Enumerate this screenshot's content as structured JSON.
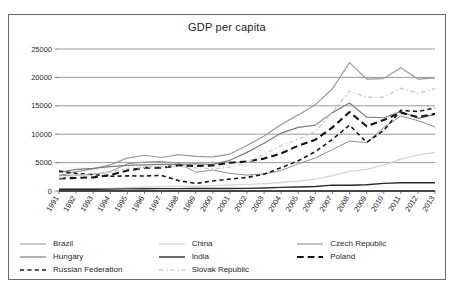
{
  "chart_data": {
    "type": "line",
    "title": "GDP per capita",
    "xlabel": "",
    "ylabel": "",
    "ylim": [
      0,
      25000
    ],
    "yticks": [
      0,
      5000,
      10000,
      15000,
      20000,
      25000
    ],
    "grid": true,
    "legend_position": "bottom",
    "categories": [
      "1991",
      "1992",
      "1993",
      "1994",
      "1995",
      "1996",
      "1997",
      "1998",
      "1999",
      "2000",
      "2001",
      "2002",
      "2003",
      "2004",
      "2005",
      "2006",
      "2007",
      "2008",
      "2009",
      "2010",
      "2011",
      "2012",
      "2013"
    ],
    "series": [
      {
        "name": "Brazil",
        "color": "#909090",
        "style": "solid",
        "width": 1,
        "values": [
          2700,
          2800,
          2900,
          3400,
          4800,
          5100,
          5200,
          4900,
          3300,
          3700,
          3100,
          2800,
          3000,
          3600,
          4800,
          5800,
          7300,
          8800,
          8500,
          11200,
          13200,
          12400,
          11300
        ]
      },
      {
        "name": "China",
        "color": "#d5d5d5",
        "style": "solid",
        "width": 1.3,
        "values": [
          330,
          370,
          380,
          470,
          600,
          700,
          780,
          820,
          860,
          950,
          1050,
          1150,
          1290,
          1500,
          1750,
          2100,
          2700,
          3450,
          3800,
          4550,
          5600,
          6300,
          6800
        ]
      },
      {
        "name": "Czech Republic",
        "color": "#9a9a9a",
        "style": "solid",
        "width": 1.2,
        "values": [
          2700,
          3400,
          3900,
          4600,
          5800,
          6300,
          5900,
          6400,
          6100,
          6000,
          6500,
          8000,
          9700,
          11700,
          13400,
          15200,
          18000,
          22600,
          19700,
          19800,
          21700,
          19700,
          19900
        ]
      },
      {
        "name": "Hungary",
        "color": "#7d7d7d",
        "style": "solid",
        "width": 1.2,
        "values": [
          3300,
          3800,
          4000,
          4300,
          4500,
          4600,
          4700,
          4700,
          4800,
          4700,
          5400,
          6800,
          8400,
          10200,
          11200,
          11600,
          13800,
          15500,
          13000,
          12900,
          14000,
          12800,
          13500
        ]
      },
      {
        "name": "India",
        "color": "#2b2b2b",
        "style": "solid",
        "width": 1.4,
        "values": [
          300,
          310,
          300,
          330,
          370,
          400,
          410,
          410,
          440,
          440,
          450,
          460,
          540,
          630,
          710,
          800,
          1030,
          1000,
          1100,
          1350,
          1460,
          1450,
          1460
        ]
      },
      {
        "name": "Poland",
        "color": "#141414",
        "style": "longdash",
        "width": 2.1,
        "values": [
          2200,
          2300,
          2400,
          2800,
          3600,
          4100,
          4100,
          4500,
          4400,
          4500,
          4980,
          5200,
          5700,
          6620,
          7980,
          9030,
          11200,
          13900,
          11400,
          12500,
          13800,
          13000,
          13600
        ]
      },
      {
        "name": "Russian Federation",
        "color": "#1a1a1a",
        "style": "shortdash",
        "width": 1.6,
        "values": [
          3500,
          3100,
          2900,
          2600,
          2660,
          2640,
          2740,
          1830,
          1330,
          1770,
          2100,
          2380,
          2970,
          4100,
          5320,
          6920,
          9100,
          11600,
          8560,
          10670,
          14200,
          14000,
          14600
        ]
      },
      {
        "name": "Slovak Republic",
        "color": "#cfcfcf",
        "style": "dashdot",
        "width": 1.5,
        "values": [
          2300,
          2700,
          3000,
          3300,
          4000,
          4200,
          4300,
          4300,
          4100,
          3900,
          4200,
          5000,
          6500,
          8000,
          9100,
          10400,
          13900,
          17600,
          16500,
          16500,
          18100,
          17200,
          18000
        ]
      }
    ]
  },
  "legend": {
    "items": [
      {
        "label": "Brazil"
      },
      {
        "label": "China"
      },
      {
        "label": "Czech Republic"
      },
      {
        "label": "Hungary"
      },
      {
        "label": "India"
      },
      {
        "label": "Poland"
      },
      {
        "label": "Russian Federation"
      },
      {
        "label": "Slovak Republic"
      }
    ]
  }
}
